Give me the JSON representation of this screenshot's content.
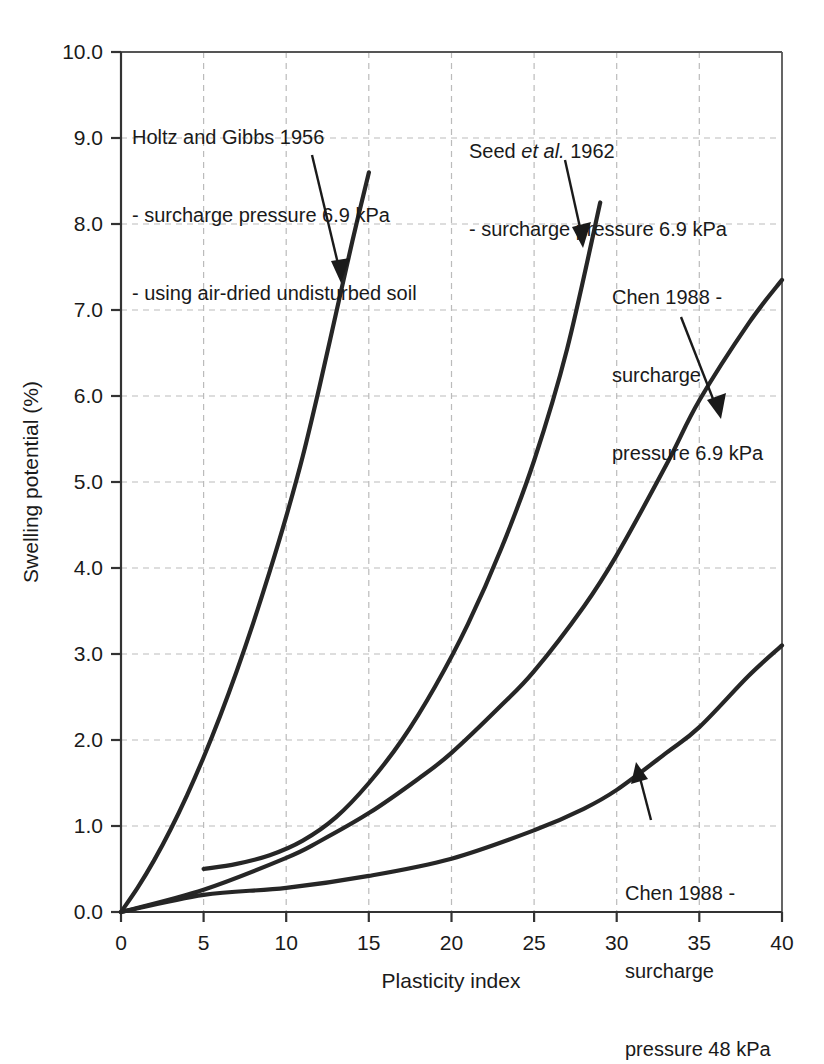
{
  "chart_data": {
    "type": "line",
    "title": "",
    "xlabel": "Plasticity index",
    "ylabel": "Swelling potential (%)",
    "xlim": [
      0,
      40
    ],
    "ylim": [
      0,
      10
    ],
    "xticks": [
      "0",
      "5",
      "10",
      "15",
      "20",
      "25",
      "30",
      "35",
      "40"
    ],
    "yticks": [
      "0.0",
      "1.0",
      "2.0",
      "3.0",
      "4.0",
      "5.0",
      "6.0",
      "7.0",
      "8.0",
      "9.0",
      "10.0"
    ],
    "grid": true,
    "legend_position": "none (inline annotations with leader arrows)",
    "line_color": "#262626",
    "grid_color": "#bbbbbb",
    "series": [
      {
        "name": "Holtz and Gibbs 1956",
        "x": [
          0,
          1,
          2,
          3,
          4,
          5,
          6,
          7,
          8,
          9,
          10,
          11,
          12,
          13,
          14,
          15
        ],
        "values": [
          0.0,
          0.28,
          0.6,
          0.96,
          1.36,
          1.8,
          2.28,
          2.8,
          3.36,
          3.96,
          4.6,
          5.3,
          6.1,
          6.95,
          7.8,
          8.6
        ]
      },
      {
        "name": "Seed et al. 1962",
        "x": [
          5,
          7,
          9,
          11,
          13,
          15,
          17,
          19,
          21,
          23,
          25,
          27,
          29
        ],
        "values": [
          0.5,
          0.56,
          0.66,
          0.83,
          1.1,
          1.5,
          2.0,
          2.62,
          3.35,
          4.22,
          5.25,
          6.55,
          8.25
        ]
      },
      {
        "name": "Chen 1988 - surcharge pressure 6.9 kPa",
        "x": [
          0,
          5,
          10,
          12,
          15,
          18,
          20,
          23,
          25,
          28,
          30,
          33,
          35,
          38,
          40
        ],
        "values": [
          0.0,
          0.26,
          0.63,
          0.82,
          1.15,
          1.55,
          1.85,
          2.4,
          2.8,
          3.55,
          4.15,
          5.2,
          5.95,
          6.85,
          7.35
        ]
      },
      {
        "name": "Chen 1988 - surcharge pressure 48 kPa",
        "x": [
          0,
          5,
          10,
          15,
          20,
          25,
          28,
          30,
          33,
          35,
          38,
          40
        ],
        "values": [
          0.0,
          0.2,
          0.28,
          0.42,
          0.62,
          0.95,
          1.2,
          1.42,
          1.85,
          2.15,
          2.75,
          3.1
        ]
      }
    ],
    "annotations": [
      {
        "id": "holtz",
        "lines": [
          "Holtz and Gibbs 1956",
          "- surcharge pressure 6.9 kPa",
          "- using air-dried undisturbed soil"
        ],
        "points_to_series": "Holtz and Gibbs 1956"
      },
      {
        "id": "seed",
        "lines": [
          "Seed et al. 1962",
          "- surcharge pressure 6.9 kPa"
        ],
        "italic_part": "et al.",
        "points_to_series": "Seed et al. 1962"
      },
      {
        "id": "chen69",
        "lines": [
          "Chen 1988 -",
          "surcharge",
          "pressure 6.9 kPa"
        ],
        "points_to_series": "Chen 1988 - surcharge pressure 6.9 kPa"
      },
      {
        "id": "chen48",
        "lines": [
          "Chen 1988 -",
          "surcharge",
          "pressure 48 kPa"
        ],
        "points_to_series": "Chen 1988 - surcharge pressure 48 kPa"
      }
    ]
  },
  "axis": {
    "x_title": "Plasticity index",
    "y_title": "Swelling potential (%)",
    "x_ticks": [
      "0",
      "5",
      "10",
      "15",
      "20",
      "25",
      "30",
      "35",
      "40"
    ],
    "y_ticks": [
      "0.0",
      "1.0",
      "2.0",
      "3.0",
      "4.0",
      "5.0",
      "6.0",
      "7.0",
      "8.0",
      "9.0",
      "10.0"
    ]
  },
  "annotations": {
    "holtz": {
      "line1": "Holtz and Gibbs 1956",
      "line2": "- surcharge pressure 6.9 kPa",
      "line3": "- using air-dried undisturbed soil"
    },
    "seed": {
      "line1_pre": "Seed ",
      "line1_italic": "et al.",
      "line1_post": " 1962",
      "line2": "- surcharge pressure 6.9 kPa"
    },
    "chen69": {
      "line1": "Chen 1988 -",
      "line2": "surcharge",
      "line3": "pressure 6.9 kPa"
    },
    "chen48": {
      "line1": "Chen 1988 -",
      "line2": "surcharge",
      "line3": "pressure 48 kPa"
    }
  }
}
